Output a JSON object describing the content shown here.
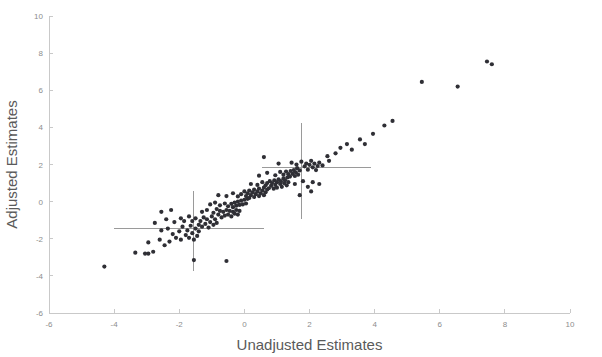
{
  "chart_data": {
    "type": "scatter",
    "title": "",
    "xlabel": "Unadjusted Estimates",
    "ylabel": "Adjusted Estimates",
    "xlim": [
      -6,
      10
    ],
    "ylim": [
      -6,
      10
    ],
    "xticks": [
      -6,
      -4,
      -2,
      0,
      2,
      4,
      6,
      8,
      10
    ],
    "yticks": [
      -6,
      -4,
      -2,
      0,
      2,
      4,
      6,
      8,
      10
    ],
    "xtick_labels": [
      "-6",
      "-4",
      "-2",
      "0",
      "2",
      "4",
      "6",
      "8",
      "10"
    ],
    "ytick_labels": [
      "-6",
      "-4",
      "-2",
      "0",
      "2",
      "4",
      "6",
      "8",
      "10"
    ],
    "grid": false,
    "legend": null,
    "marker_color": "#2f2f35",
    "marker_size": 2.1,
    "axis_color": "#c9c9c9",
    "label_color": "#5a5a5a",
    "n_points": 181,
    "points": [
      [
        -4.3,
        -3.5
      ],
      [
        -3.35,
        -2.75
      ],
      [
        -3.05,
        -2.8
      ],
      [
        -2.95,
        -2.8
      ],
      [
        -2.8,
        -2.7
      ],
      [
        -2.95,
        -2.2
      ],
      [
        -2.6,
        -2.05
      ],
      [
        -2.45,
        -2.35
      ],
      [
        -2.3,
        -2.15
      ],
      [
        -2.55,
        -1.55
      ],
      [
        -2.35,
        -1.45
      ],
      [
        -2.2,
        -1.75
      ],
      [
        -2.1,
        -1.95
      ],
      [
        -2.0,
        -1.6
      ],
      [
        -1.95,
        -2.05
      ],
      [
        -1.9,
        -1.35
      ],
      [
        -1.8,
        -1.8
      ],
      [
        -1.75,
        -1.55
      ],
      [
        -1.7,
        -1.95
      ],
      [
        -1.65,
        -1.3
      ],
      [
        -1.6,
        -1.7
      ],
      [
        -1.55,
        -2.05
      ],
      [
        -1.5,
        -1.45
      ],
      [
        -1.45,
        -1.85
      ],
      [
        -1.4,
        -1.25
      ],
      [
        -2.75,
        -1.15
      ],
      [
        -2.4,
        -0.95
      ],
      [
        -2.15,
        -1.1
      ],
      [
        -1.95,
        -0.9
      ],
      [
        -1.85,
        -1.05
      ],
      [
        -1.7,
        -0.8
      ],
      [
        -1.6,
        -1.05
      ],
      [
        -1.5,
        -0.9
      ],
      [
        -1.4,
        -1.6
      ],
      [
        -1.35,
        -1.05
      ],
      [
        -1.3,
        -1.35
      ],
      [
        -1.25,
        -0.85
      ],
      [
        -1.2,
        -1.2
      ],
      [
        -1.15,
        -0.95
      ],
      [
        -1.1,
        -1.4
      ],
      [
        -1.05,
        -1.1
      ],
      [
        -1.0,
        -0.8
      ],
      [
        -0.95,
        -1.25
      ],
      [
        -0.9,
        -0.95
      ],
      [
        -0.85,
        -1.15
      ],
      [
        -1.55,
        -3.15
      ],
      [
        -0.55,
        -3.2
      ],
      [
        -2.55,
        -0.55
      ],
      [
        -2.25,
        -0.45
      ],
      [
        -1.3,
        -0.55
      ],
      [
        -1.15,
        -0.45
      ],
      [
        -0.95,
        -0.6
      ],
      [
        -0.85,
        -0.4
      ],
      [
        -0.8,
        -0.7
      ],
      [
        -0.75,
        -0.5
      ],
      [
        -0.7,
        -0.85
      ],
      [
        -0.65,
        -0.55
      ],
      [
        -0.6,
        -0.75
      ],
      [
        -0.55,
        -0.45
      ],
      [
        -0.5,
        -0.7
      ],
      [
        -0.45,
        -0.5
      ],
      [
        -0.4,
        -0.8
      ],
      [
        -0.35,
        -0.55
      ],
      [
        -0.3,
        -0.65
      ],
      [
        -0.25,
        -0.45
      ],
      [
        -0.2,
        -0.7
      ],
      [
        -0.15,
        -0.5
      ],
      [
        -1.05,
        -0.15
      ],
      [
        -0.9,
        -0.05
      ],
      [
        -0.75,
        -0.2
      ],
      [
        -0.6,
        -0.1
      ],
      [
        -0.5,
        -0.25
      ],
      [
        -0.4,
        -0.12
      ],
      [
        -0.35,
        -0.3
      ],
      [
        -0.3,
        -0.05
      ],
      [
        -0.25,
        -0.22
      ],
      [
        -0.2,
        0.0
      ],
      [
        -0.15,
        -0.18
      ],
      [
        -0.1,
        0.05
      ],
      [
        -0.05,
        -0.15
      ],
      [
        0.0,
        0.1
      ],
      [
        0.05,
        -0.1
      ],
      [
        0.1,
        0.15
      ],
      [
        -0.8,
        0.35
      ],
      [
        -0.55,
        0.3
      ],
      [
        -0.35,
        0.45
      ],
      [
        -0.2,
        0.28
      ],
      [
        -0.1,
        0.4
      ],
      [
        0.0,
        0.55
      ],
      [
        0.05,
        0.3
      ],
      [
        0.1,
        0.45
      ],
      [
        0.15,
        0.2
      ],
      [
        0.15,
        0.6
      ],
      [
        0.2,
        0.35
      ],
      [
        0.25,
        0.5
      ],
      [
        0.3,
        0.25
      ],
      [
        0.3,
        0.65
      ],
      [
        0.35,
        0.4
      ],
      [
        0.4,
        0.55
      ],
      [
        0.45,
        0.3
      ],
      [
        0.45,
        0.7
      ],
      [
        0.5,
        0.45
      ],
      [
        0.55,
        0.6
      ],
      [
        0.6,
        0.35
      ],
      [
        0.6,
        0.75
      ],
      [
        0.65,
        0.5
      ],
      [
        0.7,
        0.65
      ],
      [
        0.2,
        0.95
      ],
      [
        0.4,
        0.9
      ],
      [
        0.55,
        1.05
      ],
      [
        0.65,
        0.88
      ],
      [
        0.7,
        1.0
      ],
      [
        0.75,
        0.72
      ],
      [
        0.78,
        1.1
      ],
      [
        0.82,
        0.85
      ],
      [
        0.85,
        1.0
      ],
      [
        0.9,
        0.7
      ],
      [
        0.92,
        1.15
      ],
      [
        0.95,
        0.9
      ],
      [
        1.0,
        1.05
      ],
      [
        1.0,
        0.75
      ],
      [
        1.05,
        1.2
      ],
      [
        1.1,
        0.95
      ],
      [
        1.12,
        1.1
      ],
      [
        1.15,
        0.8
      ],
      [
        1.2,
        1.25
      ],
      [
        1.22,
        1.0
      ],
      [
        1.25,
        1.15
      ],
      [
        1.3,
        0.88
      ],
      [
        1.32,
        1.3
      ],
      [
        1.35,
        1.05
      ],
      [
        0.45,
        1.4
      ],
      [
        0.7,
        1.55
      ],
      [
        0.95,
        1.42
      ],
      [
        1.1,
        1.6
      ],
      [
        1.2,
        1.45
      ],
      [
        1.28,
        1.62
      ],
      [
        1.35,
        1.48
      ],
      [
        1.4,
        1.35
      ],
      [
        1.42,
        1.65
      ],
      [
        1.48,
        1.5
      ],
      [
        1.52,
        1.7
      ],
      [
        1.55,
        1.38
      ],
      [
        1.58,
        1.58
      ],
      [
        1.62,
        1.8
      ],
      [
        1.65,
        1.45
      ],
      [
        1.7,
        1.68
      ],
      [
        0.6,
        2.4
      ],
      [
        1.05,
        2.05
      ],
      [
        1.45,
        2.1
      ],
      [
        1.6,
        2.0
      ],
      [
        1.75,
        2.15
      ],
      [
        1.85,
        1.9
      ],
      [
        1.9,
        2.05
      ],
      [
        1.95,
        1.72
      ],
      [
        2.0,
        1.98
      ],
      [
        2.05,
        2.2
      ],
      [
        2.1,
        1.85
      ],
      [
        2.15,
        2.05
      ],
      [
        2.2,
        1.7
      ],
      [
        2.25,
        1.92
      ],
      [
        2.3,
        2.1
      ],
      [
        2.4,
        1.95
      ],
      [
        1.55,
        0.95
      ],
      [
        1.8,
        1.1
      ],
      [
        1.95,
        0.8
      ],
      [
        2.1,
        1.05
      ],
      [
        2.3,
        0.95
      ],
      [
        1.7,
        0.35
      ],
      [
        2.05,
        0.55
      ],
      [
        2.55,
        2.45
      ],
      [
        2.6,
        2.2
      ],
      [
        2.8,
        2.6
      ],
      [
        2.95,
        2.9
      ],
      [
        3.15,
        3.1
      ],
      [
        3.3,
        2.8
      ],
      [
        3.55,
        3.35
      ],
      [
        3.7,
        3.1
      ],
      [
        3.95,
        3.65
      ],
      [
        4.3,
        4.1
      ],
      [
        4.55,
        4.35
      ],
      [
        5.45,
        6.45
      ],
      [
        6.55,
        6.2
      ],
      [
        7.45,
        7.55
      ],
      [
        7.6,
        7.4
      ]
    ],
    "error_crosses": [
      {
        "name": "cross-left",
        "x": -1.55,
        "y": -1.45,
        "x_range": [
          -4.0,
          0.6
        ],
        "y_range": [
          -3.75,
          0.55
        ]
      },
      {
        "name": "cross-right",
        "x": 1.75,
        "y": 1.85,
        "x_range": [
          0.55,
          3.9
        ],
        "y_range": [
          -0.95,
          4.25
        ]
      }
    ]
  }
}
